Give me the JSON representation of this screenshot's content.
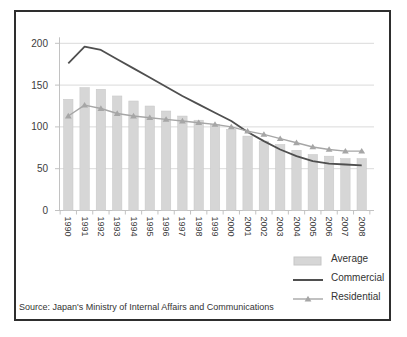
{
  "window": {
    "background": "#ffffff",
    "frame_border_color": "#2e2e2e"
  },
  "chart_data": {
    "type": "combo",
    "title": "",
    "xlabel": "",
    "ylabel": "",
    "categories": [
      "1990",
      "1991",
      "1992",
      "1993",
      "1994",
      "1995",
      "1996",
      "1997",
      "1998",
      "1999",
      "2000",
      "2001",
      "2002",
      "2003",
      "2004",
      "2005",
      "2006",
      "2007",
      "2008"
    ],
    "series": [
      {
        "name": "Average",
        "type": "bar",
        "color": "#d6d6d6",
        "edge_color": "#c6c6c6",
        "values": [
          133,
          147,
          145,
          137,
          131,
          125,
          119,
          113,
          108,
          103,
          97,
          89,
          83,
          79,
          72,
          67,
          65,
          62,
          62
        ]
      },
      {
        "name": "Commercial",
        "type": "line",
        "color": "#4f4f4f",
        "values": [
          176,
          196,
          192,
          181,
          170,
          159,
          148,
          137,
          127,
          117,
          107,
          94,
          83,
          73,
          65,
          59,
          56,
          55,
          54
        ]
      },
      {
        "name": "Residential",
        "type": "line",
        "marker": "triangle",
        "color": "#a6a6a6",
        "values": [
          113,
          126,
          122,
          116,
          113,
          111,
          109,
          107,
          105,
          103,
          100,
          95,
          91,
          86,
          81,
          76,
          73,
          71,
          71
        ]
      }
    ],
    "ylim": [
      0,
      200
    ],
    "yticks": [
      0,
      50,
      100,
      150,
      200
    ],
    "grid": true,
    "grid_color": "#dadada",
    "axis_color": "#c2c2c2",
    "text_color": "#3c3c3c",
    "legend_position": "bottom-right"
  },
  "legend": {
    "items": [
      "Average",
      "Commercial",
      "Residential"
    ]
  },
  "source_note": "Source: Japan's Ministry of Internal Affairs and Communications"
}
